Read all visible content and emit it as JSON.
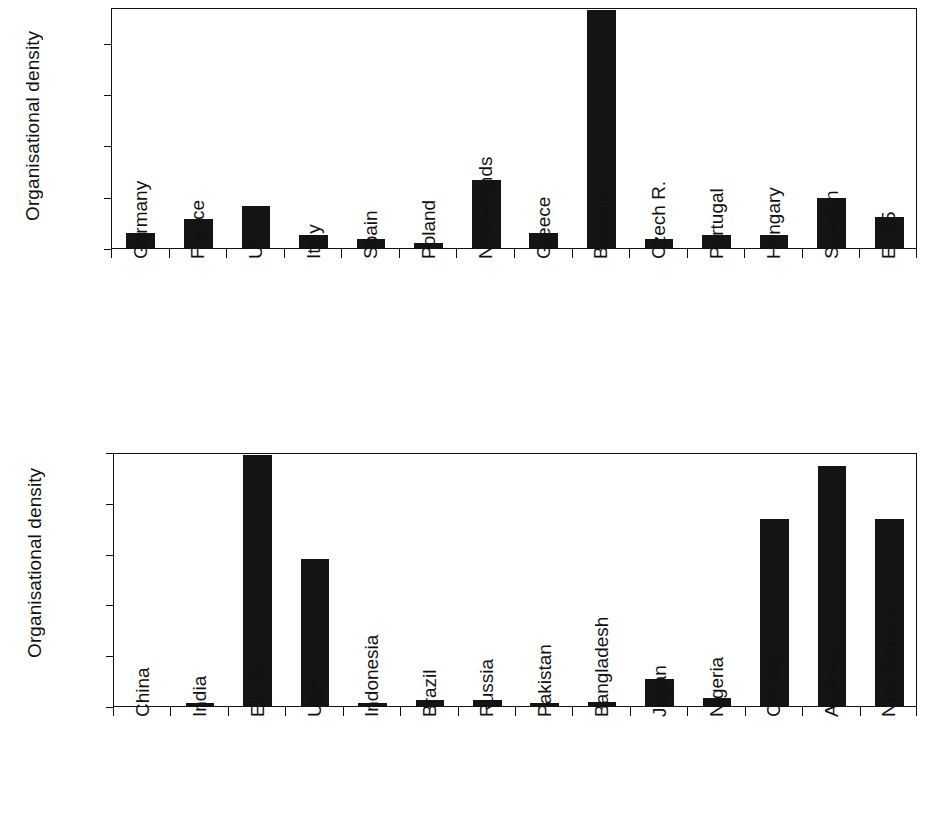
{
  "chart_data": [
    {
      "id": "top",
      "type": "bar",
      "title": "",
      "xlabel": "",
      "ylabel": "Organisational density",
      "ylim": [
        0,
        188
      ],
      "yticks": [
        0,
        40,
        80,
        120,
        160
      ],
      "ytick_labels": [
        "0",
        "40",
        "80",
        "120",
        "160"
      ],
      "grid": false,
      "legend": "none",
      "bar_color": "#141414",
      "categories": [
        "Germany",
        "France",
        "UK",
        "Italy",
        "Spain",
        "Poland",
        "Netherlands",
        "Greece",
        "Belgium",
        "Czech R.",
        "Portugal",
        "Hungary",
        "Sweden",
        "EU25"
      ],
      "values": [
        12,
        23,
        33,
        10,
        7,
        4,
        53,
        12,
        186,
        7,
        10,
        10,
        39,
        24
      ]
    },
    {
      "id": "bottom",
      "type": "bar",
      "title": "",
      "xlabel": "",
      "ylabel": "Organisational density",
      "ylim": [
        0,
        20
      ],
      "yticks": [
        0,
        4,
        8,
        12,
        16,
        20
      ],
      "ytick_labels": [
        "0",
        "4",
        "8",
        "12",
        "16",
        "20"
      ],
      "grid": false,
      "legend": "none",
      "bar_color": "#141414",
      "categories": [
        "China",
        "India",
        "EU 25",
        "USA",
        "Indonesia",
        "Brazil",
        "Russia",
        "Pakistan",
        "Bangladesh",
        "Japan",
        "Nigeria",
        "Canada",
        "Australia",
        "New Zealand"
      ],
      "values": [
        0.03,
        0.2,
        19.8,
        11.6,
        0.25,
        0.45,
        0.5,
        0.25,
        0.3,
        2.1,
        0.65,
        14.7,
        18.9,
        14.7
      ]
    }
  ]
}
